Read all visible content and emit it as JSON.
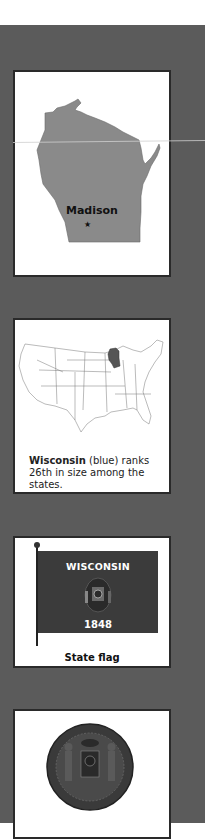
{
  "cards": {
    "state_map": {
      "capital_label": "Madison",
      "capital_marker": "★"
    },
    "us_map": {
      "caption_bold": "Wisconsin",
      "caption_rest": " (blue) ranks 26th in size among the states."
    },
    "flag": {
      "flag_title": "WISCONSIN",
      "flag_year": "1848",
      "caption": "State flag"
    },
    "seal": {
      "caption": ""
    }
  },
  "colors": {
    "band": "#5b5b5b",
    "card_border": "#2a2a2a",
    "state_fill": "#8a8a8a",
    "highlight_state": "#555555",
    "flag_field": "#3b3b3b"
  }
}
